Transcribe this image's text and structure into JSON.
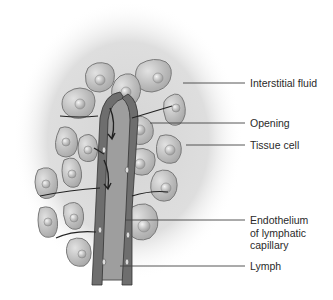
{
  "figure": {
    "type": "anatomical-illustration",
    "colors": {
      "background": "#ffffff",
      "interstitial_halo": "#d9d9d9",
      "cell_fill": "#bdbdbd",
      "cell_border": "#7a7a7a",
      "nucleus": "#a8a8a8",
      "capillary_wall": "#6e6e6e",
      "lymph": "#9e9e9e",
      "label_text": "#2a2a2a",
      "leader_line": "#444444"
    }
  },
  "labels": [
    {
      "id": "interstitial-fluid",
      "lines": [
        "Interstitial fluid"
      ],
      "y": 77,
      "line_from": 183,
      "line_y": 83
    },
    {
      "id": "opening",
      "lines": [
        "Opening"
      ],
      "y": 117,
      "line_from": 150,
      "line_y": 123
    },
    {
      "id": "tissue-cell",
      "lines": [
        "Tissue cell"
      ],
      "y": 139,
      "line_from": 186,
      "line_y": 145
    },
    {
      "id": "endothelium",
      "lines": [
        "Endothelium",
        "of lymphatic",
        "capillary"
      ],
      "y": 214,
      "line_from": 125,
      "line_y": 220
    },
    {
      "id": "lymph",
      "lines": [
        "Lymph"
      ],
      "y": 260,
      "line_from": 120,
      "line_y": 266
    }
  ]
}
